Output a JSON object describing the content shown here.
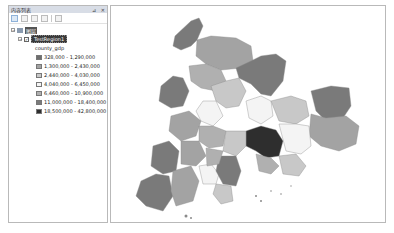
{
  "toc": {
    "title": "内容列表",
    "pin_icon": "pin-icon",
    "close_icon": "✕",
    "toolbar": [
      {
        "name": "list-by-drawing-order-button",
        "active": true
      },
      {
        "name": "list-by-source-button",
        "active": false
      },
      {
        "name": "list-by-visibility-button",
        "active": false
      },
      {
        "name": "list-by-selection-button",
        "active": false
      },
      {
        "name": "options-button",
        "active": false
      }
    ],
    "data_frame_label": "图层",
    "layer": {
      "name": "TestRegion1",
      "checked": true,
      "field": "county_gdp"
    },
    "legend": [
      {
        "label": "328,000 - 1,290,000",
        "color": "#6e6e6e"
      },
      {
        "label": "1,300,000 - 2,430,000",
        "color": "#a3a3a3"
      },
      {
        "label": "2,440,000 - 4,030,000",
        "color": "#c8c8c8"
      },
      {
        "label": "4,040,000 - 6,450,000",
        "color": "#f4f4f4"
      },
      {
        "label": "6,460,000 - 10,900,000",
        "color": "#b0b0b0"
      },
      {
        "label": "11,000,000 - 18,400,000",
        "color": "#7a7a7a"
      },
      {
        "label": "18,500,000 - 42,800,000",
        "color": "#2e2e2e"
      }
    ]
  },
  "map": {
    "colors": {
      "c1": "#6e6e6e",
      "c2": "#a3a3a3",
      "c3": "#c8c8c8",
      "c4": "#f4f4f4",
      "c5": "#b0b0b0",
      "c6": "#7a7a7a",
      "c7": "#2e2e2e",
      "outline": "#8a8a8a"
    }
  }
}
